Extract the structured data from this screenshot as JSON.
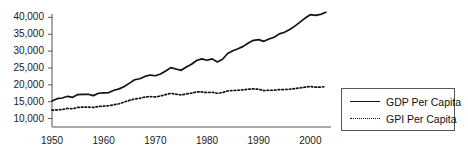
{
  "chart_data": {
    "type": "line",
    "title": "",
    "xlabel": "",
    "ylabel": "",
    "xlim": [
      1950,
      2004
    ],
    "ylim": [
      7500,
      41000
    ],
    "grid": false,
    "legend_position": "right",
    "yticks": [
      "10,000",
      "15,000",
      "20,000",
      "25,000",
      "30,000",
      "35,000",
      "40,000"
    ],
    "ytick_values": [
      10000,
      15000,
      20000,
      25000,
      30000,
      35000,
      40000
    ],
    "xticks": [
      "1950",
      "1960",
      "1970",
      "1980",
      "1990",
      "2000"
    ],
    "xtick_values": [
      1950,
      1960,
      1970,
      1980,
      1990,
      2000
    ],
    "x": [
      1950,
      1951,
      1952,
      1953,
      1954,
      1955,
      1956,
      1957,
      1958,
      1959,
      1960,
      1961,
      1962,
      1963,
      1964,
      1965,
      1966,
      1967,
      1968,
      1969,
      1970,
      1971,
      1972,
      1973,
      1974,
      1975,
      1976,
      1977,
      1978,
      1979,
      1980,
      1981,
      1982,
      1983,
      1984,
      1985,
      1986,
      1987,
      1988,
      1989,
      1990,
      1991,
      1992,
      1993,
      1994,
      1995,
      1996,
      1997,
      1998,
      1999,
      2000,
      2001,
      2002,
      2003
    ],
    "series": [
      {
        "name": "GDP Per Capita",
        "style": "solid",
        "color": "#111111",
        "values": [
          15200,
          15900,
          16100,
          16600,
          16300,
          17100,
          17200,
          17200,
          16800,
          17500,
          17600,
          17700,
          18400,
          18800,
          19500,
          20500,
          21500,
          21800,
          22500,
          22900,
          22700,
          23200,
          24100,
          25100,
          24700,
          24300,
          25300,
          26100,
          27200,
          27700,
          27300,
          27700,
          26800,
          27600,
          29300,
          30100,
          30700,
          31400,
          32400,
          33200,
          33400,
          32900,
          33600,
          34100,
          35100,
          35600,
          36400,
          37400,
          38600,
          39800,
          40800,
          40600,
          40900,
          41500
        ]
      },
      {
        "name": "GPI Per Capita",
        "style": "dotted",
        "color": "#111111",
        "values": [
          12500,
          12600,
          12700,
          13000,
          12900,
          13300,
          13400,
          13400,
          13300,
          13600,
          13700,
          13800,
          14100,
          14400,
          14900,
          15400,
          15800,
          16000,
          16400,
          16500,
          16400,
          16700,
          17100,
          17500,
          17200,
          17000,
          17300,
          17500,
          17900,
          17900,
          17700,
          17800,
          17500,
          17700,
          18200,
          18300,
          18400,
          18500,
          18700,
          18800,
          18700,
          18300,
          18400,
          18400,
          18600,
          18600,
          18700,
          18900,
          19100,
          19300,
          19500,
          19300,
          19300,
          19500
        ]
      }
    ]
  },
  "legend": {
    "items": [
      {
        "label": "GDP Per Capita",
        "style": "solid"
      },
      {
        "label": "GPI Per Capita",
        "style": "dotted"
      }
    ]
  }
}
